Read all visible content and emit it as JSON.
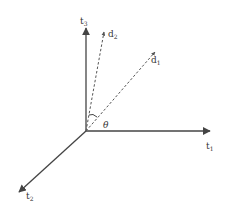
{
  "diagram": {
    "type": "3d-vector-space",
    "colors": {
      "axis": "#444444",
      "vector": "#555555",
      "text": "#333333",
      "background": "#ffffff"
    },
    "axes": [
      {
        "id": "t1",
        "label_base": "t",
        "label_sub": "1"
      },
      {
        "id": "t2",
        "label_base": "t",
        "label_sub": "2"
      },
      {
        "id": "t3",
        "label_base": "t",
        "label_sub": "3"
      }
    ],
    "vectors": [
      {
        "id": "d1",
        "label_base": "d",
        "label_sub": "1",
        "style": "dashed"
      },
      {
        "id": "d2",
        "label_base": "d",
        "label_sub": "2",
        "style": "dashed"
      }
    ],
    "angle": {
      "label": "θ",
      "between": [
        "d1",
        "d2"
      ]
    }
  }
}
